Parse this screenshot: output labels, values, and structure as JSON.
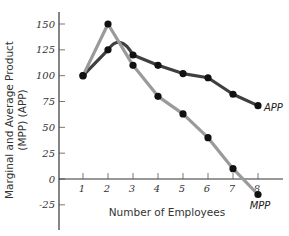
{
  "chart_data": {
    "type": "line",
    "title": "",
    "xlabel": "Number of Employees",
    "ylabel": "Marginal and Average Product (MPP) (APP)",
    "ylabel_lines": [
      "Marginal and Average Product",
      "(MPP) (APP)"
    ],
    "x": [
      1,
      2,
      3,
      4,
      5,
      6,
      7,
      8
    ],
    "x_ticks": [
      1,
      2,
      3,
      4,
      5,
      6,
      7,
      8
    ],
    "y_ticks": [
      150,
      125,
      100,
      75,
      50,
      25,
      0,
      -25
    ],
    "ylim": [
      -45,
      165
    ],
    "xlim": [
      0,
      9
    ],
    "grid": false,
    "legend": "inline labels at line ends",
    "series": [
      {
        "name": "MPP",
        "label": "MPP",
        "color": "#9a9a9a",
        "values": [
          100,
          150,
          110,
          80,
          63,
          40,
          10,
          -15
        ]
      },
      {
        "name": "APP",
        "label": "APP",
        "color": "#3f3f3f",
        "values": [
          100,
          125,
          120,
          110,
          102,
          98,
          82,
          71
        ],
        "smooth_peak": {
          "x": 2.5,
          "y": 132
        }
      }
    ],
    "marker_color": "#111111"
  }
}
